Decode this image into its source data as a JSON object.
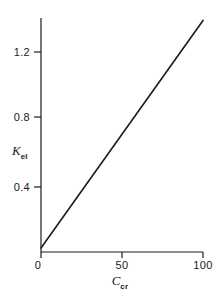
{
  "chart_data": {
    "type": "line",
    "title": "",
    "xlabel": "C_cr",
    "ylabel": "K_el",
    "xlabel_base": "C",
    "xlabel_sub": "cr",
    "ylabel_base": "K",
    "ylabel_sub": "el",
    "xlim": [
      0,
      100
    ],
    "ylim": [
      0,
      1.45
    ],
    "grid": false,
    "legend": null,
    "xticks": [
      0,
      50,
      100
    ],
    "xtick_labels": [
      "0",
      "50",
      "100"
    ],
    "yticks": [
      0.4,
      0.8,
      1.2
    ],
    "ytick_labels": [
      "0.4",
      "0.8",
      "1.2"
    ],
    "tick_direction": "out",
    "series": [
      {
        "name": "K_el vs C_cr",
        "color": "#1b1b1b",
        "linewidth": 1.6,
        "x": [
          0,
          10,
          20,
          30,
          40,
          50,
          60,
          70,
          80,
          90,
          100
        ],
        "values": [
          0.025,
          0.166,
          0.307,
          0.448,
          0.589,
          0.73,
          0.871,
          1.012,
          1.153,
          1.294,
          1.435
        ]
      }
    ],
    "annotations": []
  },
  "axis": {
    "color": "#1b1b1b",
    "spine_left": true,
    "spine_bottom": true,
    "spine_top": false,
    "spine_right": false
  }
}
